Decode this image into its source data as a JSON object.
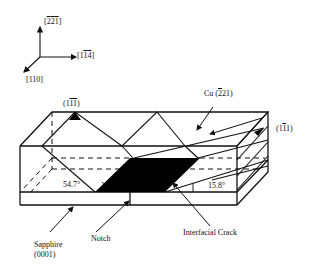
{
  "figure": {
    "type": "crystallographic bicrystal specimen schematic",
    "colors": {
      "line": "#111111",
      "background": "#ffffff",
      "crack_fill": "#000000"
    }
  },
  "axes": {
    "up": {
      "label_parts": [
        "[",
        "2",
        "2",
        "1",
        "]"
      ],
      "label": "[-2-2-1]"
    },
    "right": {
      "label_parts": [
        "[1",
        "1",
        "4",
        "]"
      ],
      "label": "[1-1-4]"
    },
    "front": {
      "label": "[110]"
    }
  },
  "labels": {
    "plane_left": {
      "pre": "(1",
      "bar": "11",
      "post": ")",
      "text": "(1-1-1)"
    },
    "cu": {
      "pre": "Cu (",
      "bar": "2",
      "post": "21)",
      "text": "Cu (-221)"
    },
    "plane_right": {
      "pre": "(1",
      "bar": "1",
      "post": "1)",
      "text": "(1-11)"
    },
    "angle_left": "54.7°",
    "angle_right": "15.8°",
    "sapphire_line1": "Sapphire",
    "sapphire_line2": "(0001)",
    "notch": "Notch",
    "crack": "Interfacial Crack"
  }
}
